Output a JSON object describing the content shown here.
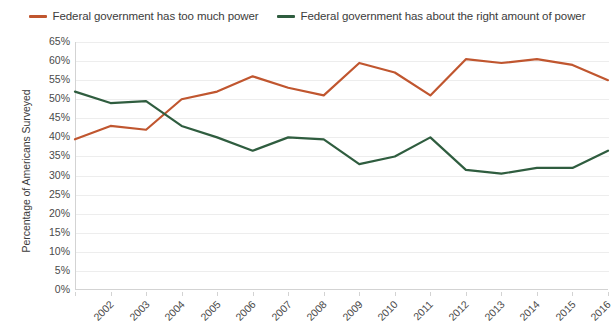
{
  "chart_data": {
    "type": "line",
    "title": "",
    "xlabel": "",
    "ylabel": "Percentage of Americans Surveyed",
    "categories": [
      "2002",
      "2003",
      "2004",
      "2005",
      "2006",
      "2007",
      "2008",
      "2009",
      "2010",
      "2011",
      "2012",
      "2013",
      "2014",
      "2015",
      "2016",
      "2017"
    ],
    "ylim": [
      0,
      65
    ],
    "ytick_labels": [
      "65%",
      "60%",
      "55%",
      "50%",
      "45%",
      "40%",
      "35%",
      "30%",
      "25%",
      "20%",
      "15%",
      "10%",
      "5%",
      "0%"
    ],
    "ytick_values": [
      65,
      60,
      55,
      50,
      45,
      40,
      35,
      30,
      25,
      20,
      15,
      10,
      5,
      0
    ],
    "grid": true,
    "legend_position": "top-center",
    "series": [
      {
        "name": "Federal government has too much power",
        "color": "#c0562f",
        "values": [
          39.5,
          43,
          42,
          50,
          52,
          56,
          53,
          51,
          59.5,
          57,
          51,
          60.5,
          59.5,
          60.5,
          59,
          55
        ]
      },
      {
        "name": "Federal government has about the right amount of power",
        "color": "#2f5d3f",
        "values": [
          52,
          49,
          49.5,
          43,
          40,
          36.5,
          40,
          39.5,
          33,
          35,
          40,
          31.5,
          30.5,
          32,
          32,
          36.5
        ]
      }
    ]
  }
}
